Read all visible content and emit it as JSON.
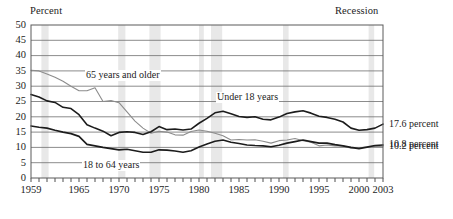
{
  "chart_data": {
    "type": "line",
    "title": "",
    "ylabel": "Percent",
    "xlabel": "",
    "ylim": [
      0,
      50
    ],
    "ytick_step": 5,
    "yticks": [
      "50",
      "45",
      "40",
      "35",
      "30",
      "25",
      "20",
      "15",
      "10",
      "5",
      "0"
    ],
    "xlim": [
      1959,
      2003
    ],
    "xticks": [
      "1959",
      "1965",
      "1970",
      "1975",
      "1980",
      "1985",
      "1990",
      "1995",
      "2000",
      "2003"
    ],
    "xtick_values": [
      1959,
      1965,
      1970,
      1975,
      1980,
      1985,
      1990,
      1995,
      2000,
      2003
    ],
    "minor_tick_interval": 1,
    "grid": "horizontal",
    "legend_position": "inline-annotations",
    "recession_label": "Recession",
    "recession_color": "#e8e8e8",
    "recession_bands": [
      [
        1960.3,
        1961.2
      ],
      [
        1969.9,
        1970.8
      ],
      [
        1973.8,
        1975.2
      ],
      [
        1980.0,
        1980.6
      ],
      [
        1981.5,
        1982.9
      ],
      [
        1990.5,
        1991.2
      ],
      [
        2001.2,
        2001.9
      ]
    ],
    "series": [
      {
        "name": "65 years and older",
        "label": "65 years and older",
        "color": "#8c8c8c",
        "end_label": "10.2 percent",
        "x": [
          1959,
          1960,
          1961,
          1962,
          1963,
          1964,
          1965,
          1966,
          1967,
          1968,
          1969,
          1970,
          1971,
          1972,
          1973,
          1974,
          1975,
          1976,
          1977,
          1978,
          1979,
          1980,
          1981,
          1982,
          1983,
          1984,
          1985,
          1986,
          1987,
          1988,
          1989,
          1990,
          1991,
          1992,
          1993,
          1994,
          1995,
          1996,
          1997,
          1998,
          1999,
          2000,
          2001,
          2002,
          2003
        ],
        "values": [
          35.2,
          35.0,
          34.0,
          32.9,
          31.6,
          30.0,
          28.5,
          28.5,
          29.5,
          25.0,
          25.3,
          24.6,
          21.6,
          18.6,
          16.3,
          14.6,
          15.3,
          15.0,
          14.1,
          14.0,
          15.2,
          15.7,
          15.3,
          14.6,
          13.8,
          12.4,
          12.6,
          12.4,
          12.5,
          12.0,
          11.4,
          12.2,
          12.4,
          12.9,
          12.2,
          11.7,
          10.5,
          10.8,
          10.5,
          10.5,
          9.7,
          9.9,
          10.1,
          10.4,
          10.2
        ]
      },
      {
        "name": "18 to 64 years",
        "label": "18 to 64 years",
        "color": "#1c1c1c",
        "end_label": "10.8 percent",
        "x": [
          1959,
          1960,
          1961,
          1962,
          1963,
          1964,
          1965,
          1966,
          1967,
          1968,
          1969,
          1970,
          1971,
          1972,
          1973,
          1974,
          1975,
          1976,
          1977,
          1978,
          1979,
          1980,
          1981,
          1982,
          1983,
          1984,
          1985,
          1986,
          1987,
          1988,
          1989,
          1990,
          1991,
          1992,
          1993,
          1994,
          1995,
          1996,
          1997,
          1998,
          1999,
          2000,
          2001,
          2002,
          2003
        ],
        "values": [
          17.0,
          16.6,
          16.3,
          15.6,
          15.0,
          14.5,
          13.6,
          11.0,
          10.5,
          10.0,
          9.6,
          9.2,
          9.4,
          8.9,
          8.4,
          8.4,
          9.2,
          9.1,
          8.8,
          8.4,
          8.9,
          10.1,
          11.1,
          12.0,
          12.4,
          11.7,
          11.3,
          10.8,
          10.6,
          10.5,
          10.2,
          10.7,
          11.4,
          11.9,
          12.4,
          11.9,
          11.4,
          11.4,
          10.9,
          10.5,
          10.0,
          9.6,
          10.1,
          10.6,
          10.8
        ]
      },
      {
        "name": "Under 18 years",
        "label": "Under 18 years",
        "color": "#1c1c1c",
        "end_label": "17.6 percent",
        "x": [
          1959,
          1960,
          1961,
          1962,
          1963,
          1964,
          1965,
          1966,
          1967,
          1968,
          1969,
          1970,
          1971,
          1972,
          1973,
          1974,
          1975,
          1976,
          1977,
          1978,
          1979,
          1980,
          1981,
          1982,
          1983,
          1984,
          1985,
          1986,
          1987,
          1988,
          1989,
          1990,
          1991,
          1992,
          1993,
          1994,
          1995,
          1996,
          1997,
          1998,
          1999,
          2000,
          2001,
          2002,
          2003
        ],
        "values": [
          27.3,
          26.5,
          25.2,
          24.7,
          23.1,
          22.7,
          20.7,
          17.4,
          16.3,
          15.3,
          13.8,
          14.9,
          15.1,
          14.9,
          14.2,
          15.1,
          16.8,
          15.8,
          16.0,
          15.7,
          16.0,
          17.9,
          19.5,
          21.3,
          21.8,
          21.0,
          20.1,
          19.8,
          20.0,
          19.2,
          19.0,
          19.9,
          21.1,
          21.6,
          22.0,
          21.2,
          20.2,
          19.8,
          19.2,
          18.3,
          16.3,
          15.6,
          15.8,
          16.3,
          17.6
        ]
      }
    ]
  },
  "labels": {
    "percent": "Percent",
    "recession": "Recession"
  }
}
